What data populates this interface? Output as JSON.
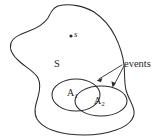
{
  "figure": {
    "type": "venn-diagram",
    "background_color": "#ffffff",
    "stroke_color": "#2b2b2b"
  },
  "labels": {
    "sample_point": "s",
    "sample_space": "S",
    "event_a1_base": "A",
    "event_a1_sub": "1",
    "event_a2_base": "A",
    "event_a2_sub": "2",
    "events_callout": "events"
  },
  "elements": {
    "sample_space_blob": "sample-space-outline",
    "sample_point_dot": "sample-point-dot",
    "ellipse_a1": "event-a1-ellipse",
    "ellipse_a2": "event-a2-ellipse",
    "arrow_to_a1": "events-arrow-left",
    "arrow_to_a2": "events-arrow-right"
  },
  "geometry": {
    "canvas_width": 162,
    "canvas_height": 139,
    "sample_point": {
      "x": 71,
      "y": 36
    },
    "ellipse_a1": {
      "cx": 76,
      "cy": 95,
      "rx": 24,
      "ry": 16
    },
    "ellipse_a2": {
      "cx": 101,
      "cy": 101,
      "rx": 26,
      "ry": 15
    },
    "events_anchor": {
      "x": 120,
      "y": 66
    },
    "arrow_tip_left": {
      "x": 97,
      "y": 80
    },
    "arrow_tip_right": {
      "x": 112,
      "y": 86
    }
  }
}
